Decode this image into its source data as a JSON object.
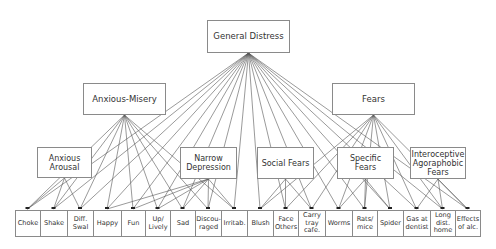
{
  "diagram": {
    "general": {
      "id": "general",
      "label": "General Distress",
      "box": [
        207,
        20,
        83,
        33
      ]
    },
    "middle": [
      {
        "id": "anxmis",
        "label": "Anxious-Misery",
        "box": [
          83,
          83,
          83,
          32
        ]
      },
      {
        "id": "fears",
        "label": "Fears",
        "box": [
          332,
          83,
          83,
          32
        ]
      }
    ],
    "lower": [
      {
        "id": "arousal",
        "label": "Anxious\nArousal",
        "box": [
          37,
          147,
          55,
          31
        ]
      },
      {
        "id": "narrow",
        "label": "Narrow\nDepression",
        "box": [
          180,
          147,
          57,
          32
        ]
      },
      {
        "id": "social",
        "label": "Social Fears",
        "box": [
          257,
          147,
          57,
          32
        ]
      },
      {
        "id": "specific",
        "label": "Specific Fears",
        "box": [
          337,
          147,
          57,
          32
        ]
      },
      {
        "id": "intero",
        "label": "Interoceptive\nAgoraphobic\nFears",
        "box": [
          410,
          147,
          56,
          32
        ]
      }
    ],
    "leaves": [
      {
        "id": "choke",
        "label": "Choke",
        "x": 15,
        "w": 25
      },
      {
        "id": "shake",
        "label": "Shake",
        "x": 40,
        "w": 27
      },
      {
        "id": "diffswal",
        "label": "Diff.\nSwal",
        "x": 67,
        "w": 26
      },
      {
        "id": "happy",
        "label": "Happy",
        "x": 93,
        "w": 28
      },
      {
        "id": "fun",
        "label": "Fun",
        "x": 121,
        "w": 24
      },
      {
        "id": "uplively",
        "label": "Up/\nLively",
        "x": 145,
        "w": 25
      },
      {
        "id": "sad",
        "label": "Sad",
        "x": 170,
        "w": 25
      },
      {
        "id": "discouraged",
        "label": "Discou-\nraged",
        "x": 195,
        "w": 26
      },
      {
        "id": "irritab",
        "label": "Irritab.",
        "x": 221,
        "w": 26
      },
      {
        "id": "blush",
        "label": "Blush",
        "x": 247,
        "w": 26
      },
      {
        "id": "faceothers",
        "label": "Face\nOthers",
        "x": 273,
        "w": 25
      },
      {
        "id": "carrytray",
        "label": "Carry\ntray\ncafe.",
        "x": 298,
        "w": 27
      },
      {
        "id": "worms",
        "label": "Worms",
        "x": 325,
        "w": 27
      },
      {
        "id": "ratsmice",
        "label": "Rats/\nmice",
        "x": 352,
        "w": 25
      },
      {
        "id": "spider",
        "label": "Spider",
        "x": 377,
        "w": 26
      },
      {
        "id": "gasdentist",
        "label": "Gas at\ndentist",
        "x": 403,
        "w": 27
      },
      {
        "id": "longdist",
        "label": "Long\ndist.\nhome",
        "x": 430,
        "w": 25
      },
      {
        "id": "effectsalc",
        "label": "Effects\nof alc.",
        "x": 455,
        "w": 25
      }
    ],
    "leaf_y": 210,
    "leaf_h": 27,
    "edges": {
      "general": [
        "choke",
        "shake",
        "diffswal",
        "happy",
        "fun",
        "uplively",
        "sad",
        "discouraged",
        "irritab",
        "blush",
        "faceothers",
        "carrytray",
        "worms",
        "ratsmice",
        "spider",
        "gasdentist",
        "longdist",
        "effectsalc"
      ],
      "anxmis": [
        "choke",
        "shake",
        "diffswal",
        "happy",
        "fun",
        "uplively",
        "sad",
        "discouraged",
        "irritab"
      ],
      "fears": [
        "blush",
        "faceothers",
        "carrytray",
        "worms",
        "ratsmice",
        "spider",
        "gasdentist",
        "longdist",
        "effectsalc"
      ],
      "arousal": [
        "choke",
        "shake",
        "diffswal"
      ],
      "narrow": [
        "happy",
        "fun",
        "uplively",
        "sad",
        "discouraged",
        "irritab"
      ],
      "social": [
        "blush",
        "faceothers",
        "carrytray"
      ],
      "specific": [
        "worms",
        "ratsmice",
        "spider"
      ],
      "intero": [
        "gasdentist",
        "longdist",
        "effectsalc"
      ]
    },
    "colors": {
      "line": "#555555",
      "border": "#8a8a8a",
      "text": "#333333"
    }
  }
}
